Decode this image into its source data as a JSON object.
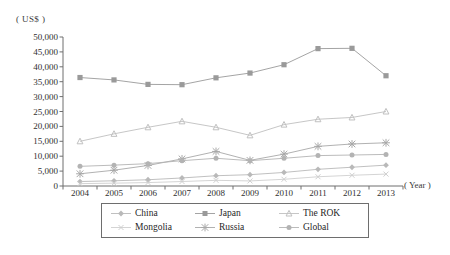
{
  "axis": {
    "unit_label": "( US$ )",
    "year_label": "( Year )",
    "y_ticks": [
      "50,000",
      "45,000",
      "40,000",
      "35,000",
      "30,000",
      "25,000",
      "20,000",
      "15,000",
      "10,000",
      "5,000",
      "0"
    ],
    "x_ticks": [
      "2004",
      "2005",
      "2006",
      "2007",
      "2008",
      "2009",
      "2010",
      "2011",
      "2012",
      "2013"
    ]
  },
  "legend": {
    "items": [
      {
        "label": "China",
        "marker": "diamond",
        "color": "#b9b9b9"
      },
      {
        "label": "Japan",
        "marker": "square",
        "color": "#9a9a9a"
      },
      {
        "label": "The ROK",
        "marker": "triangle",
        "color": "#c0c0c0"
      },
      {
        "label": "Mongolia",
        "marker": "cross",
        "color": "#cfcfcf"
      },
      {
        "label": "Russia",
        "marker": "star",
        "color": "#a8a8a8"
      },
      {
        "label": "Global",
        "marker": "circle",
        "color": "#b3b3b3"
      }
    ]
  },
  "chart_data": {
    "type": "line",
    "title": "",
    "xlabel": "( Year )",
    "ylabel": "( US$ )",
    "x": [
      2004,
      2005,
      2006,
      2007,
      2008,
      2009,
      2010,
      2011,
      2012,
      2013
    ],
    "ylim": [
      0,
      50000
    ],
    "ytick_step": 5000,
    "grid": false,
    "legend_position": "bottom",
    "series": [
      {
        "name": "China",
        "marker": "diamond",
        "color": "#b9b9b9",
        "values": [
          1500,
          1750,
          2100,
          2700,
          3450,
          3800,
          4550,
          5600,
          6300,
          7000
        ]
      },
      {
        "name": "Japan",
        "marker": "square",
        "color": "#9a9a9a",
        "values": [
          36400,
          35600,
          34100,
          34000,
          36300,
          37900,
          40700,
          46100,
          46200,
          37000
        ]
      },
      {
        "name": "The ROK",
        "marker": "triangle",
        "color": "#c0c0c0",
        "values": [
          15000,
          17500,
          19700,
          21700,
          19700,
          17000,
          20600,
          22400,
          23000,
          25000
        ]
      },
      {
        "name": "Mongolia",
        "marker": "cross",
        "color": "#cfcfcf",
        "values": [
          800,
          950,
          1150,
          1500,
          1900,
          1700,
          2250,
          3100,
          3600,
          4000
        ]
      },
      {
        "name": "Russia",
        "marker": "star",
        "color": "#a8a8a8",
        "values": [
          4100,
          5300,
          6900,
          9100,
          11600,
          8600,
          10700,
          13300,
          14100,
          14500
        ]
      },
      {
        "name": "Global",
        "marker": "circle",
        "color": "#b3b3b3",
        "values": [
          6600,
          7000,
          7500,
          8500,
          9300,
          8500,
          9300,
          10200,
          10400,
          10600
        ]
      }
    ]
  }
}
